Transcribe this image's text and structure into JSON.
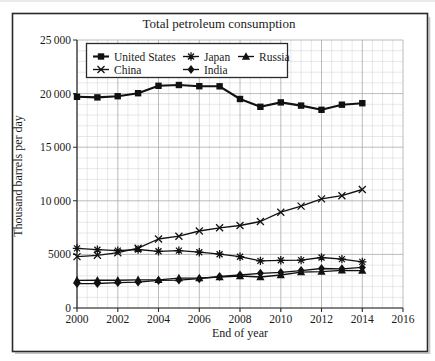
{
  "chart_data": {
    "type": "line",
    "title": "Total petroleum consumption",
    "xlabel": "End of year",
    "ylabel": "Thousand barrels per day",
    "x_range": [
      2000,
      2016
    ],
    "y_range": [
      0,
      25000
    ],
    "x_major_step": 2,
    "x_minor_step": 0.5,
    "y_major_step": 5000,
    "y_minor_step": 1000,
    "grid": "minor-and-major",
    "legend_position": "upper-left-inside",
    "x_ticks": {
      "values": [
        2000,
        2002,
        2004,
        2006,
        2008,
        2010,
        2012,
        2014,
        2016
      ],
      "labels": [
        "2000",
        "2002",
        "2004",
        "2006",
        "2008",
        "2010",
        "2012",
        "2014",
        "2016"
      ]
    },
    "y_ticks": {
      "values": [
        0,
        5000,
        10000,
        15000,
        20000,
        25000
      ],
      "labels": [
        "0",
        "5000",
        "10 000",
        "15 000",
        "20 000",
        "25 000"
      ]
    },
    "x": [
      2000,
      2001,
      2002,
      2003,
      2004,
      2005,
      2006,
      2007,
      2008,
      2009,
      2010,
      2011,
      2012,
      2013,
      2014
    ],
    "series": [
      {
        "name": "United States",
        "marker": "square",
        "values": [
          19701,
          19649,
          19761,
          20034,
          20731,
          20802,
          20687,
          20680,
          19498,
          18771,
          19180,
          18882,
          18490,
          18961,
          19106
        ]
      },
      {
        "name": "Japan",
        "marker": "asterisk",
        "values": [
          5556,
          5435,
          5359,
          5455,
          5286,
          5354,
          5203,
          5014,
          4785,
          4390,
          4451,
          4467,
          4714,
          4557,
          4297
        ]
      },
      {
        "name": "Russia",
        "marker": "triangle",
        "values": [
          2583,
          2590,
          2597,
          2622,
          2634,
          2785,
          2803,
          2885,
          2982,
          2888,
          3082,
          3353,
          3395,
          3515,
          3493
        ]
      },
      {
        "name": "China",
        "marker": "x",
        "values": [
          4796,
          4918,
          5161,
          5578,
          6437,
          6695,
          7182,
          7480,
          7697,
          8069,
          8938,
          9504,
          10175,
          10480,
          11056
        ]
      },
      {
        "name": "India",
        "marker": "diamond",
        "values": [
          2280,
          2285,
          2374,
          2420,
          2573,
          2606,
          2737,
          2941,
          3077,
          3237,
          3319,
          3488,
          3685,
          3660,
          3790
        ]
      }
    ],
    "colors": {
      "series_line": "#111111",
      "grid_minor": "#d7d7d7",
      "grid_major": "#ababab",
      "axis": "#2b2b2b",
      "text": "#1a1a1a",
      "figure_border": "#2a2a2a",
      "legend_border": "#2a2a2a",
      "background": "#ffffff"
    }
  }
}
